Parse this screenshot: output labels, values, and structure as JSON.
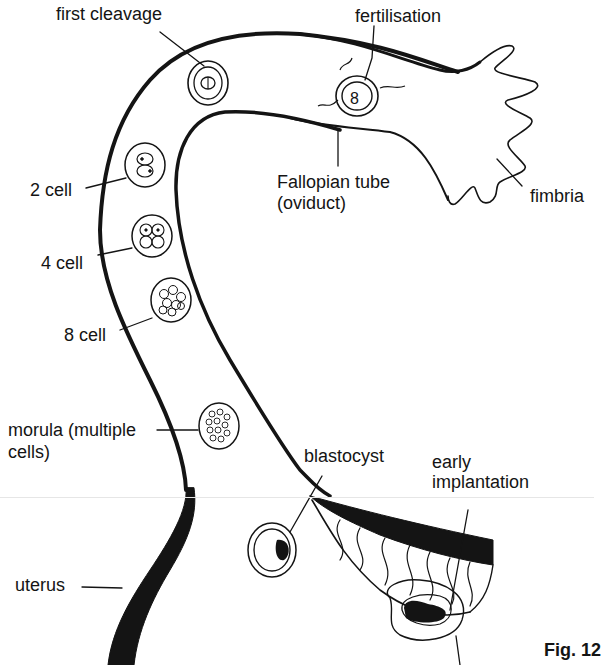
{
  "figure": {
    "caption": "Fig. 12",
    "ink_color": "#141414",
    "background": "#ffffff"
  },
  "labels": {
    "first_cleavage": "first cleavage",
    "fertilisation": "fertilisation",
    "two_cell": "2 cell",
    "fallopian_tube_line1": "Fallopian tube",
    "fallopian_tube_line2": "(oviduct)",
    "fimbria": "fimbria",
    "four_cell": "4 cell",
    "eight_cell": "8 cell",
    "morula_line1": "morula (multiple",
    "morula_line2": "cells)",
    "blastocyst": "blastocyst",
    "early_implantation_line1": "early",
    "early_implantation_line2": "implantation",
    "uterus": "uterus",
    "fig_caption": "Fig. 12"
  },
  "stages": [
    {
      "name": "fertilisation",
      "order": 1
    },
    {
      "name": "first cleavage",
      "order": 2
    },
    {
      "name": "2 cell",
      "order": 3
    },
    {
      "name": "4 cell",
      "order": 4
    },
    {
      "name": "8 cell",
      "order": 5
    },
    {
      "name": "morula (multiple cells)",
      "order": 6
    },
    {
      "name": "blastocyst",
      "order": 7
    },
    {
      "name": "early implantation",
      "order": 8
    }
  ]
}
